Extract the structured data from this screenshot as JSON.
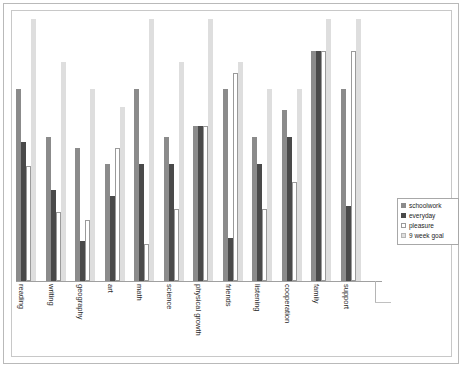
{
  "chart_data": {
    "type": "bar",
    "title": "",
    "xlabel": "",
    "ylabel": "",
    "ylim": [
      0,
      100
    ],
    "grid": false,
    "legend_position": "right",
    "categories": [
      "reading",
      "writing",
      "geography",
      "art",
      "math",
      "science",
      "physical growth",
      "friends",
      "listening",
      "cooperation",
      "family",
      "support"
    ],
    "series": [
      {
        "name": "schoolwork",
        "color": "#8b8b8b",
        "values": [
          72,
          54,
          50,
          44,
          72,
          54,
          58,
          72,
          54,
          64,
          86,
          72
        ]
      },
      {
        "name": "everyday",
        "color": "#4a4a4a",
        "values": [
          52,
          34,
          15,
          32,
          44,
          44,
          58,
          16,
          44,
          54,
          86,
          28
        ]
      },
      {
        "name": "pleasure",
        "color": "#ffffff",
        "values": [
          43,
          26,
          23,
          50,
          14,
          27,
          58,
          78,
          27,
          37,
          86,
          86
        ]
      },
      {
        "name": "9 week goal",
        "color": "#dedede",
        "values": [
          98,
          82,
          72,
          65,
          98,
          82,
          98,
          82,
          72,
          72,
          98,
          98
        ]
      }
    ]
  },
  "legend": {
    "items": [
      {
        "label": "schoolwork"
      },
      {
        "label": "everyday"
      },
      {
        "label": "pleasure"
      },
      {
        "label": "9 week goal"
      }
    ]
  }
}
